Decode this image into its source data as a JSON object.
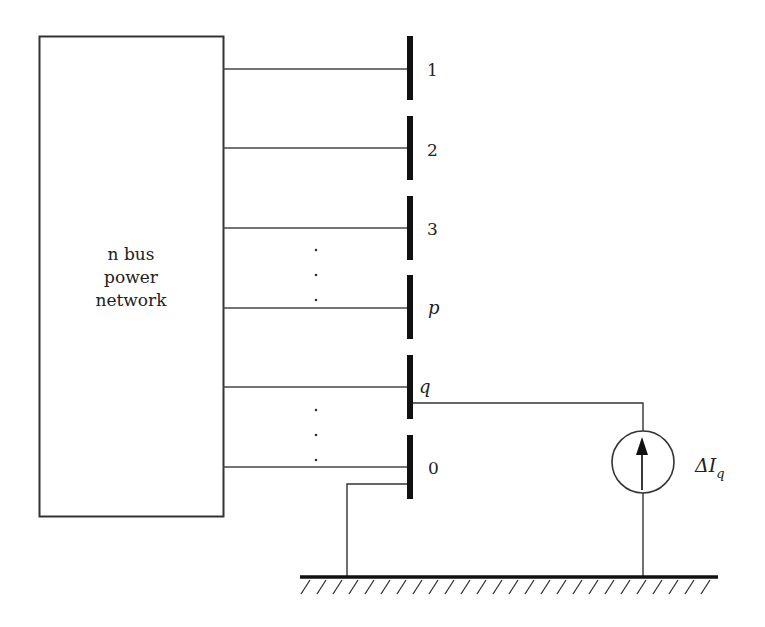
{
  "network_box": {
    "line1": "n bus",
    "line2": "power",
    "line3": "network"
  },
  "buses": [
    {
      "label": "1",
      "italic": false
    },
    {
      "label": "2",
      "italic": false
    },
    {
      "label": "3",
      "italic": false
    },
    {
      "label": "p",
      "italic": true
    },
    {
      "label": "q",
      "italic": true
    },
    {
      "label": "0",
      "italic": false
    }
  ],
  "source": {
    "label_main": "ΔI",
    "label_sub": "q",
    "icon": "current-source-icon"
  },
  "ground": {
    "icon": "ground-hatch-icon"
  },
  "ellipsis": [
    "·",
    "·",
    "·"
  ]
}
